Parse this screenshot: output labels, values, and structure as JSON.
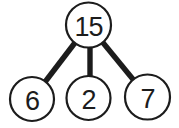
{
  "diagram": {
    "type": "number-bond",
    "whole": "15",
    "parts": [
      "6",
      "2",
      "7"
    ],
    "colors": {
      "stroke": "#1c1c1c",
      "text": "#1c1c1c",
      "node_fill": "#ffffff",
      "background": "#ffffff"
    }
  }
}
